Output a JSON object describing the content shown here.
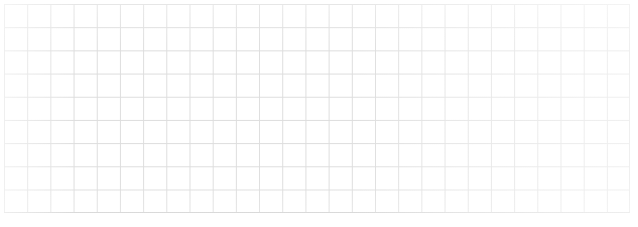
{
  "document": {
    "kind": "grid-paper-scan",
    "title": "Blank squared grid paper",
    "content_text": "",
    "has_handwriting": false,
    "has_printed_text": false
  },
  "canvas": {
    "width_px": 638,
    "height_px": 227,
    "background_color": "#ffffff"
  },
  "grid": {
    "columns": 27,
    "rows": 9,
    "cell_size_px": 23.2,
    "offset_left_px": 4,
    "offset_top_px": 4,
    "block_width_px": 626.4,
    "block_height_px": 208.8,
    "line_color": "#dddddd",
    "horizontal_line_color": "#dcdcdc",
    "bottom_border_color": "#d2d2d2",
    "line_width_px": 1,
    "shape": "square"
  },
  "margins": {
    "left_px": 4,
    "top_px": 4,
    "right_px": 8,
    "bottom_px": 14,
    "margin_color": "#ffffff"
  },
  "appearance": {
    "texture": "scanned-paper",
    "ink_fade": "edges lighter than center",
    "paper_color": "#ffffff"
  }
}
